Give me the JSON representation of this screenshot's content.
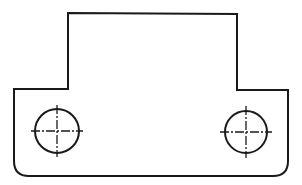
{
  "drawing": {
    "type": "engineering-front-view",
    "colors": {
      "line": "#1a1a1a",
      "background": "#ffffff"
    },
    "outline": {
      "path": "M 68 13 L 237 14 L 237 90 L 288 90 L 288 161 Q 288 176 273 176 L 29 176 Q 14 176 14 161 L 14 89 L 68 89 Z"
    },
    "holes": [
      {
        "id": "left-hole",
        "cx": 57,
        "cy": 131,
        "r": 22,
        "centerline_extent": 26
      },
      {
        "id": "right-hole",
        "cx": 246,
        "cy": 132,
        "r": 21,
        "centerline_extent": 26
      }
    ]
  }
}
